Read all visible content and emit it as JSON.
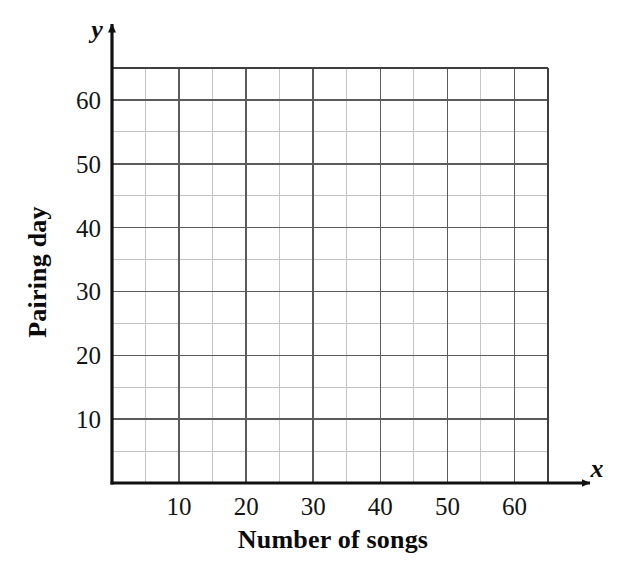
{
  "chart_data": {
    "type": "scatter",
    "title": "",
    "subtitle": "",
    "xlabel": "Number of songs",
    "ylabel": "Pairing day",
    "x_axis_symbol": "x",
    "y_axis_symbol": "y",
    "xlim": [
      0,
      65
    ],
    "ylim": [
      0,
      65
    ],
    "x_ticks": [
      10,
      20,
      30,
      40,
      50,
      60
    ],
    "y_ticks": [
      10,
      20,
      30,
      40,
      50,
      60
    ],
    "x_tick_labels": [
      "10",
      "20",
      "30",
      "40",
      "50",
      "60"
    ],
    "y_tick_labels": [
      "10",
      "20",
      "30",
      "40",
      "50",
      "60"
    ],
    "major_grid_step": 10,
    "minor_grid_step": 5,
    "grid": "on",
    "legend": "none",
    "series": [
      {
        "name": "",
        "x": [],
        "y": []
      }
    ],
    "annotations": [],
    "colors": {
      "axis": "#111111",
      "major_grid": "#5b5b5b",
      "minor_grid": "#c4c4c4",
      "grid_border": "#3f3f3f",
      "text": "#111111",
      "background": "#ffffff"
    }
  },
  "figure": {
    "plot_area": {
      "left": 112,
      "top": 68,
      "right": 548,
      "bottom": 483
    },
    "x_axis_arrow_end": 590,
    "y_axis_arrow_end": 24
  }
}
